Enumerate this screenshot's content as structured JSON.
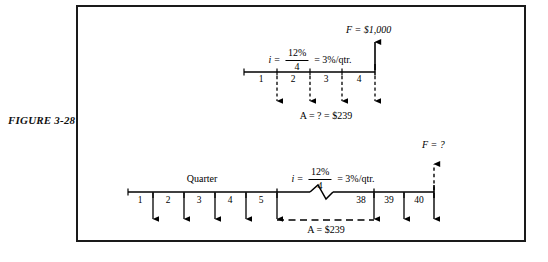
{
  "figure": {
    "label": "FIGURE 3-28"
  },
  "diagrams": [
    {
      "id": "upper-cash-flow-diagram",
      "timeline_unit_label": "",
      "rate": {
        "symbol": "i",
        "equals": "=",
        "numerator": "12%",
        "denominator": "4",
        "result": "= 3%/qtr."
      },
      "periods": [
        "1",
        "2",
        "3",
        "4"
      ],
      "future_value_label": "F = $1,000",
      "annuity_label": "A = ?  = $239",
      "arrow_direction_annuity": "down",
      "arrow_direction_future": "up"
    },
    {
      "id": "lower-cash-flow-diagram",
      "timeline_unit_label": "Quarter",
      "rate": {
        "symbol": "i",
        "equals": "=",
        "numerator": "12%",
        "denominator": "4",
        "result": "= 3%/qtr."
      },
      "periods_left": [
        "1",
        "2",
        "3",
        "4",
        "5"
      ],
      "periods_right": [
        "38",
        "39",
        "40"
      ],
      "future_value_label": "F = ?",
      "annuity_label": "A = $239",
      "arrow_direction_annuity": "down",
      "arrow_direction_future": "up",
      "has_axis_break": true
    }
  ],
  "colors": {
    "ink": "#000000",
    "frame": "#1a1a1a",
    "paper": "#ffffff"
  }
}
